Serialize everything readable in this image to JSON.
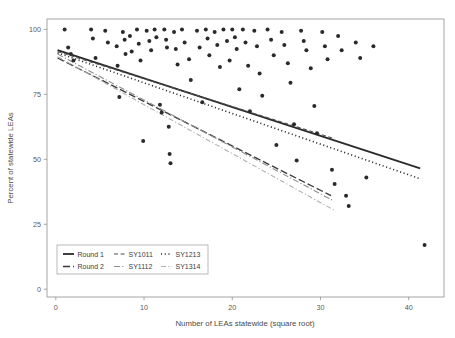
{
  "chart_data": {
    "type": "scatter",
    "title": "",
    "subtitle": "",
    "xlabel": "Number of LEAs statewide (square root)",
    "ylabel": "Percent of statewide LEAs",
    "xlim": [
      -1.0,
      44.0
    ],
    "ylim": [
      -3.0,
      104.0
    ],
    "xticks": [
      0,
      10,
      20,
      30,
      40
    ],
    "xtick_labels": [
      "0",
      "10",
      "20",
      "30",
      "40"
    ],
    "yticks": [
      0,
      25,
      50,
      75,
      100
    ],
    "ytick_labels": [
      "0",
      "25",
      "50",
      "75",
      "100"
    ],
    "grid": false,
    "legend_position": "bottom-left",
    "point_color": "#2a2a2a",
    "point_size": 2.0,
    "scatter_points": [
      [
        1.0,
        100.0
      ],
      [
        1.4,
        93.0
      ],
      [
        1.7,
        90.5
      ],
      [
        2.0,
        88.0
      ],
      [
        4.0,
        100.0
      ],
      [
        4.2,
        96.5
      ],
      [
        4.5,
        89.0
      ],
      [
        5.6,
        99.5
      ],
      [
        5.9,
        95.0
      ],
      [
        6.9,
        93.5
      ],
      [
        7.0,
        86.0
      ],
      [
        7.2,
        74.0
      ],
      [
        7.6,
        99.0
      ],
      [
        7.8,
        96.0
      ],
      [
        7.9,
        90.5
      ],
      [
        8.4,
        97.5
      ],
      [
        8.6,
        91.5
      ],
      [
        9.2,
        100.0
      ],
      [
        9.4,
        94.5
      ],
      [
        9.6,
        88.0
      ],
      [
        9.9,
        57.0
      ],
      [
        10.3,
        99.5
      ],
      [
        10.6,
        95.5
      ],
      [
        10.8,
        92.0
      ],
      [
        11.2,
        100.0
      ],
      [
        11.4,
        97.0
      ],
      [
        11.8,
        71.0
      ],
      [
        12.0,
        68.0
      ],
      [
        12.3,
        100.0
      ],
      [
        12.5,
        96.0
      ],
      [
        12.6,
        93.0
      ],
      [
        12.8,
        62.5
      ],
      [
        12.9,
        52.0
      ],
      [
        13.0,
        48.5
      ],
      [
        13.4,
        99.0
      ],
      [
        13.6,
        92.5
      ],
      [
        13.8,
        86.5
      ],
      [
        14.3,
        100.0
      ],
      [
        14.6,
        95.0
      ],
      [
        15.1,
        88.5
      ],
      [
        15.3,
        80.5
      ],
      [
        16.0,
        99.5
      ],
      [
        16.3,
        93.0
      ],
      [
        16.6,
        72.0
      ],
      [
        17.0,
        100.0
      ],
      [
        17.2,
        96.5
      ],
      [
        17.4,
        90.0
      ],
      [
        18.0,
        99.0
      ],
      [
        18.3,
        94.0
      ],
      [
        18.6,
        85.5
      ],
      [
        19.0,
        100.0
      ],
      [
        19.4,
        95.5
      ],
      [
        19.7,
        88.0
      ],
      [
        20.0,
        100.0
      ],
      [
        20.3,
        97.0
      ],
      [
        20.5,
        92.5
      ],
      [
        20.8,
        77.0
      ],
      [
        21.2,
        100.0
      ],
      [
        21.5,
        95.0
      ],
      [
        21.8,
        86.0
      ],
      [
        22.0,
        68.5
      ],
      [
        22.5,
        99.5
      ],
      [
        22.8,
        93.5
      ],
      [
        23.1,
        83.0
      ],
      [
        23.4,
        74.5
      ],
      [
        24.0,
        100.0
      ],
      [
        24.4,
        96.0
      ],
      [
        24.7,
        90.0
      ],
      [
        25.0,
        55.5
      ],
      [
        25.6,
        99.0
      ],
      [
        25.9,
        94.0
      ],
      [
        26.3,
        87.0
      ],
      [
        26.6,
        79.5
      ],
      [
        27.0,
        63.5
      ],
      [
        27.3,
        49.5
      ],
      [
        27.8,
        99.5
      ],
      [
        28.1,
        95.5
      ],
      [
        28.4,
        92.0
      ],
      [
        28.9,
        85.0
      ],
      [
        29.3,
        70.5
      ],
      [
        29.6,
        60.0
      ],
      [
        30.2,
        99.0
      ],
      [
        30.5,
        93.5
      ],
      [
        30.8,
        88.5
      ],
      [
        31.3,
        46.0
      ],
      [
        31.6,
        40.5
      ],
      [
        32.0,
        97.5
      ],
      [
        32.4,
        92.0
      ],
      [
        32.9,
        36.0
      ],
      [
        33.2,
        32.0
      ],
      [
        34.0,
        95.0
      ],
      [
        34.5,
        89.0
      ],
      [
        35.2,
        43.0
      ],
      [
        36.0,
        93.5
      ],
      [
        41.8,
        17.0
      ]
    ],
    "series": [
      {
        "name": "Round 1",
        "legend_key": "round-1",
        "linestyle": "solid",
        "color": "#2a2a2a",
        "linewidth": 1.8,
        "x_start": 0.2,
        "y_start": 92.0,
        "x_end": 41.3,
        "y_end": 46.5
      },
      {
        "name": "Round 2",
        "legend_key": "round-2",
        "linestyle": "longdash",
        "color": "#3a3a3a",
        "linewidth": 1.3,
        "x_start": 0.2,
        "y_start": 89.0,
        "x_end": 31.2,
        "y_end": 36.0
      },
      {
        "name": "SY1011",
        "legend_key": "sy1011",
        "linestyle": "dashed",
        "color": "#4f4f4f",
        "linewidth": 1.1,
        "x_start": 0.2,
        "y_start": 91.5,
        "x_end": 31.5,
        "y_end": 58.0
      },
      {
        "name": "SY1112",
        "legend_key": "sy1112",
        "linestyle": "dashdot",
        "color": "#8e8e8e",
        "linewidth": 1.1,
        "x_start": 0.2,
        "y_start": 90.5,
        "x_end": 31.5,
        "y_end": 34.0
      },
      {
        "name": "SY1213",
        "legend_key": "sy1213",
        "linestyle": "dotted",
        "color": "#2a2a2a",
        "linewidth": 1.6,
        "x_start": 0.2,
        "y_start": 91.0,
        "x_end": 41.3,
        "y_end": 42.5
      },
      {
        "name": "SY1314",
        "legend_key": "sy1314",
        "linestyle": "dotdash-light",
        "color": "#b0b0b0",
        "linewidth": 1.1,
        "x_start": 0.2,
        "y_start": 89.5,
        "x_end": 31.5,
        "y_end": 30.5
      }
    ]
  },
  "legend": {
    "rows": [
      {
        "items": [
          {
            "label": "Round 1",
            "key": "round-1"
          },
          {
            "label": "SY1011",
            "key": "sy1011"
          },
          {
            "label": "SY1213",
            "key": "sy1213"
          }
        ]
      },
      {
        "items": [
          {
            "label": "Round 2",
            "key": "round-2"
          },
          {
            "label": "SY1112",
            "key": "sy1112"
          },
          {
            "label": "SY1314",
            "key": "sy1314"
          }
        ]
      }
    ]
  }
}
